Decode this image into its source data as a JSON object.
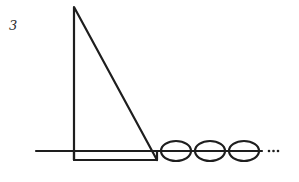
{
  "figure": {
    "label": "3",
    "stroke_color": "#1e1e1e",
    "background": "#ffffff",
    "elements": {
      "baseline": {
        "x1": 36,
        "x2": 262,
        "y": 151
      },
      "triangle": {
        "apex": [
          74,
          7
        ],
        "base_left": [
          74,
          160
        ],
        "base_right": [
          157,
          160
        ]
      },
      "base_strip": {
        "x": 74,
        "y": 151,
        "width": 83,
        "height": 9
      },
      "links": [
        {
          "cx": 176,
          "cy": 151,
          "rx": 15,
          "ry": 10
        },
        {
          "cx": 210,
          "cy": 151,
          "rx": 15,
          "ry": 10
        },
        {
          "cx": 244,
          "cy": 151,
          "rx": 15,
          "ry": 10
        }
      ],
      "continuation": "..."
    }
  }
}
